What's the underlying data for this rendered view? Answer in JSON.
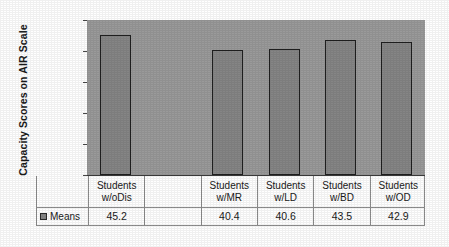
{
  "chart_data": {
    "type": "bar",
    "title": "",
    "xlabel": "",
    "ylabel": "Capacity Scores on AIR Scale",
    "ylim": [
      0,
      50
    ],
    "yticks": [
      0,
      10,
      20,
      30,
      40,
      50
    ],
    "grid": false,
    "legend_position": "bottom-left",
    "categories": [
      "Students w/oDis",
      "",
      "Students w/MR",
      "Students w/LD",
      "Students w/BD",
      "Students w/OD"
    ],
    "category_lines": [
      [
        "Students",
        "w/oDis"
      ],
      [
        "",
        ""
      ],
      [
        "Students",
        "w/MR"
      ],
      [
        "Students",
        "w/LD"
      ],
      [
        "Students",
        "w/BD"
      ],
      [
        "Students",
        "w/OD"
      ]
    ],
    "series": [
      {
        "name": "Means",
        "values": [
          45.2,
          null,
          40.4,
          40.6,
          43.5,
          42.9
        ],
        "value_labels": [
          "45.2",
          "",
          "40.4",
          "40.6",
          "43.5",
          "42.9"
        ],
        "color": "#858585"
      }
    ]
  },
  "legend": {
    "series_label": "Means",
    "swatch": "series-color-swatch"
  },
  "colors": {
    "plot_background": "#9a9a9a",
    "bar_fill": "#858585",
    "bar_outline": "#1f1f1f",
    "axis": "#3a3a3a",
    "table_border": "#8c8c8c",
    "page_background": "#ffffff"
  }
}
